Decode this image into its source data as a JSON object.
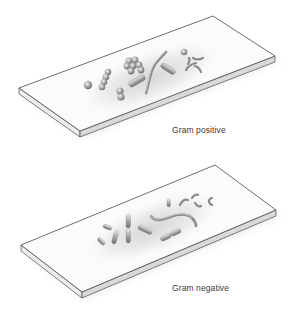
{
  "figure": {
    "panels": [
      {
        "id": "gram-positive",
        "caption": "Gram positive",
        "organisms": [
          "coccus",
          "streptococci chain",
          "staphylococci cluster",
          "diplococcus",
          "bacillus",
          "spirillum",
          "coccus",
          "spirochete-like fragments"
        ]
      },
      {
        "id": "gram-negative",
        "caption": "Gram negative",
        "organisms": [
          "coccobacilli",
          "bacilli",
          "streptobacilli chain",
          "spirillum",
          "vibrio / curved rods"
        ]
      }
    ],
    "colors": {
      "background": "#ffffff",
      "slide_face": "#fbfbfb",
      "slide_edge": "#d9d9d9",
      "outline": "#4a4a4a",
      "stain_haze": "#bdbdbd",
      "organism": "#9a9a9a",
      "caption_text": "#3a3a3a"
    }
  }
}
